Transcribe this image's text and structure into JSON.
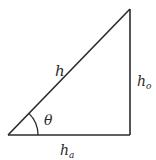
{
  "diagram": {
    "type": "right-triangle",
    "stroke_color": "#2a2a2a",
    "vertices": {
      "angle_vertex": [
        8,
        135
      ],
      "right_angle_vertex": [
        130,
        135
      ],
      "top_vertex": [
        130,
        9
      ]
    },
    "labels": {
      "hypotenuse": "h",
      "opposite_main": "h",
      "opposite_sub": "o",
      "adjacent_main": "h",
      "adjacent_sub": "a",
      "angle": "θ"
    }
  }
}
